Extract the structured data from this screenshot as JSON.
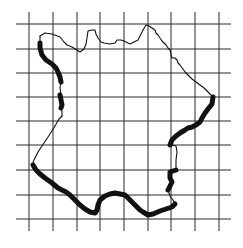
{
  "figure": {
    "grid": {
      "vertical_x": [
        29,
        53,
        77,
        100,
        124,
        148,
        171,
        195,
        219
      ],
      "horizontal_y": [
        24,
        49,
        73,
        97,
        121,
        145,
        170,
        195,
        219
      ],
      "x_extent": [
        16,
        231
      ],
      "y_extent": [
        12,
        231
      ],
      "color": "#2a2a2a"
    },
    "outline": {
      "land_border_path": "M40,36 L45,33 L52,34 L60,37 L64,42 L67,45 L72,47 L80,52 L84,49 L86,44 L87,38 L88,31 L92,30 L95,30 L96,34 L98,38 L101,42 L104,43 L110,44 L115,43 L117,40 L121,40 L124,41 L128,43 L130,44 L134,42 L138,40 L140,36 L143,30 L146,25 L149,26 L152,28 L155,30 L156,33 L158,35 L160,38 L162,41 L164,43 L166,45 L168,48 L170,50 L171,54 L172,58 L175,58 L177,60 L178,63 L180,65 L183,69 L185,72 L188,75 L192,79 L196,82 L200,85 L204,88 L206,90 L210,94 L213,97",
      "west_border_path": "M33,162 L38,152 L44,143 L50,134 L55,126 L59,119 L62,116",
      "thick_coast_paths": [
        "M213,97 L212,104 L208,109 L205,113 L202,118 L200,122 L196,125 L192,127 L188,128 L185,130 L180,133 L176,136 L172,140 L170,145",
        "M176,170 L170,172 L170,178 L172,182 L170,186 L168,190",
        "M33,165 L36,170 L40,174 L45,178 L52,183 L58,188 L62,190 L66,192 L70,195 L75,200 L80,205 L85,209 L90,212 L95,213 L97,210 L98,205 L100,200 L105,196 L110,194 L115,193 L120,194 L125,195 L130,200 L135,205 L140,210 L143,212 L148,215 L153,214 L160,211 L166,209 L172,207 L175,204",
        "M40,43 L40,48 L42,55 L46,60 L52,64 L56,68 L58,72 L60,77 L61,82",
        "M60,95 L61,100 L62,105 L61,108"
      ],
      "thin_coast_paths": [
        "M170,145 L176,146 L177,152 L176,160 L176,166 L176,170",
        "M168,190 L170,196 L173,200 L175,204",
        "M61,82 L60,88 L61,95",
        "M61,108 L62,112 L62,116",
        "M40,36 L40,43"
      ],
      "stroke_color": "#111111",
      "thick_width": 5,
      "thin_width": 1.1
    }
  }
}
